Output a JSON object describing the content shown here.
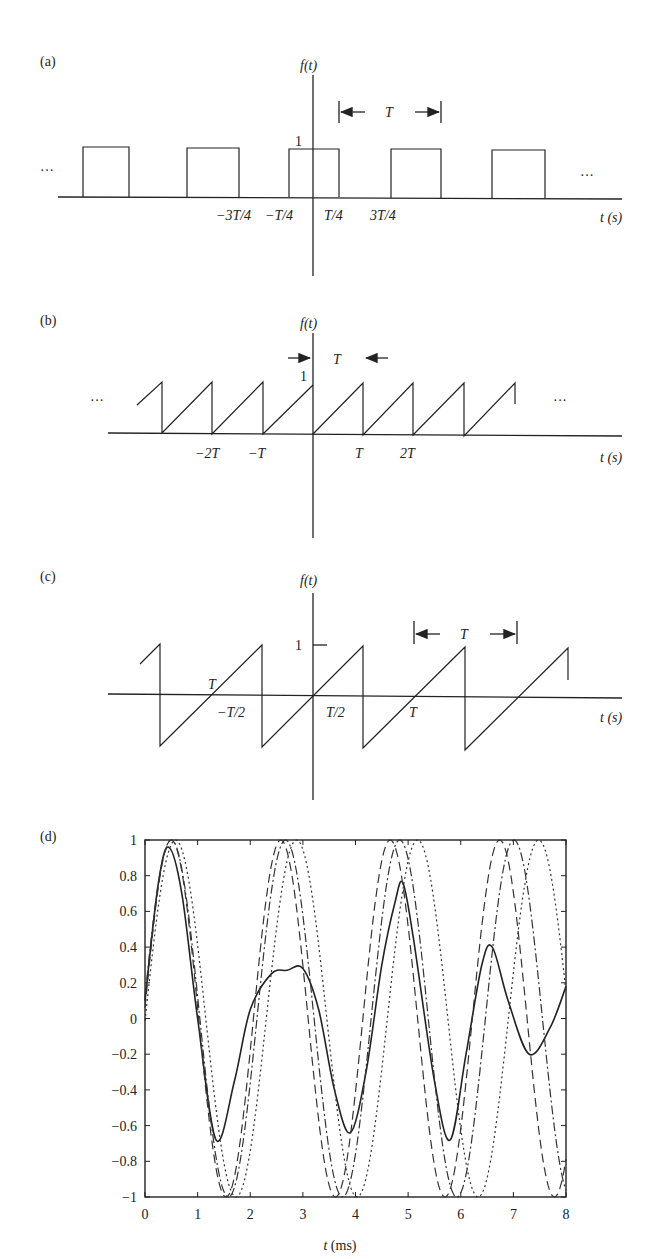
{
  "figure": {
    "panels": [
      {
        "id": "a",
        "label": "(a)",
        "y_axis_label": "f(t)",
        "x_axis_label": "t (s)",
        "amplitude_label": "1",
        "period_label": "T",
        "ellipsis_left": "···",
        "ellipsis_right": "···",
        "tick_labels": [
          "−3T/4",
          "−T/4",
          "T/4",
          "3T/4"
        ],
        "description": "Periodic rectangular pulse train, amplitude 1, pulse width T/2 centered at 0"
      },
      {
        "id": "b",
        "label": "(b)",
        "y_axis_label": "f(t)",
        "x_axis_label": "t (s)",
        "amplitude_label": "1",
        "period_label": "T",
        "ellipsis_left": "···",
        "ellipsis_right": "···",
        "tick_labels": [
          "−2T",
          "−T",
          "T",
          "2T"
        ],
        "description": "Periodic sawtooth from 0 to 1 with period T"
      },
      {
        "id": "c",
        "label": "(c)",
        "y_axis_label": "f(t)",
        "x_axis_label": "t (s)",
        "amplitude_label": "1",
        "period_label": "T",
        "tick_labels": [
          "T",
          "−T/2",
          "T/2",
          "T"
        ],
        "description": "Periodic sawtooth from −1 to 1 with period T, zero crossings at multiples of T"
      }
    ]
  },
  "chart_data": {
    "type": "line",
    "panel_label": "(d)",
    "title": "",
    "xlabel": "t (ms)",
    "ylabel": "",
    "xlim": [
      0,
      8
    ],
    "ylim": [
      -1,
      1
    ],
    "x_ticks": [
      "0",
      "1",
      "2",
      "3",
      "4",
      "5",
      "6",
      "7",
      "8"
    ],
    "y_ticks": [
      "1",
      "0.8",
      "0.6",
      "0.4",
      "0.2",
      "0",
      "−0.2",
      "−0.4",
      "−0.6",
      "−0.8",
      "−1"
    ],
    "grid": false,
    "legend": "none",
    "series": [
      {
        "name": "sum (solid)",
        "style": "solid",
        "x": [
          0,
          0.25,
          0.45,
          0.7,
          1.0,
          1.35,
          1.7,
          2.0,
          2.4,
          2.7,
          3.0,
          3.3,
          3.6,
          3.9,
          4.2,
          4.5,
          4.75,
          4.9,
          5.1,
          5.5,
          5.8,
          6.1,
          6.4,
          6.6,
          6.9,
          7.3,
          7.7,
          8.0
        ],
        "y": [
          0.1,
          0.75,
          0.96,
          0.7,
          0.0,
          -0.68,
          -0.35,
          0.05,
          0.25,
          0.27,
          0.28,
          0.05,
          -0.4,
          -0.64,
          -0.3,
          0.3,
          0.65,
          0.76,
          0.45,
          -0.35,
          -0.68,
          -0.2,
          0.3,
          0.4,
          0.1,
          -0.2,
          -0.05,
          0.18
        ]
      },
      {
        "name": "harmonic 1 (dashed)",
        "style": "dashed",
        "amplitude": 1,
        "period_ms": 2.08,
        "phase_note": "peaks near 0.5, 2.6, 4.6, 6.7 ms"
      },
      {
        "name": "harmonic 2 (dash-dot)",
        "style": "dashdot",
        "amplitude": 1,
        "period_ms": 2.17,
        "phase_note": "peaks near 0.5, 2.7, 4.9, 7.0 ms"
      },
      {
        "name": "harmonic 3 (dotted)",
        "style": "dotted",
        "amplitude": 1,
        "period_ms": 2.3,
        "phase_note": "peaks near 0.6, 2.9, 5.2, 7.5 ms"
      }
    ]
  }
}
